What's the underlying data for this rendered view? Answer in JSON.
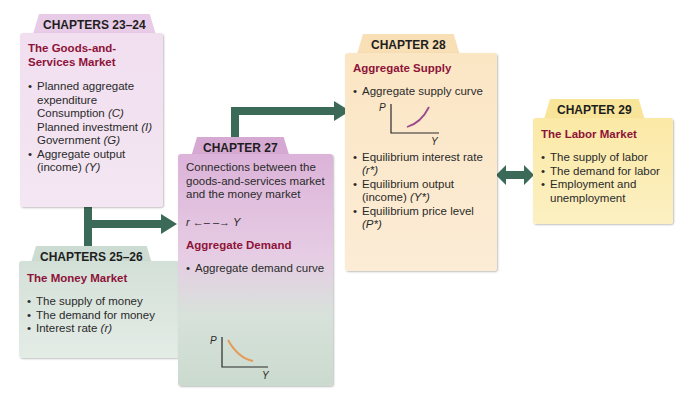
{
  "colors": {
    "title_accent": "#8e1338",
    "arrow": "#3c6a58",
    "ad_curve": "#e79a57",
    "as_curve": "#9a4a8c"
  },
  "boxes": {
    "ch23_24": {
      "tab": "CHAPTERS 23–24",
      "title": "The Goods-and-Services Market",
      "items": [
        {
          "text": "Planned aggregate expenditure",
          "bullet": true
        },
        {
          "text": "Consumption ",
          "var": "(C)",
          "bullet": false
        },
        {
          "text": "Planned investment ",
          "var": "(I)",
          "bullet": false
        },
        {
          "text": "Government ",
          "var": "(G)",
          "bullet": false
        },
        {
          "text": "Aggregate output (income) ",
          "var": "(Y)",
          "bullet": true
        }
      ]
    },
    "ch25_26": {
      "tab": "CHAPTERS 25–26",
      "title": "The Money Market",
      "items": [
        {
          "text": "The supply of money"
        },
        {
          "text": "The demand for money"
        },
        {
          "text": "Interest rate ",
          "var": "(r)"
        }
      ]
    },
    "ch27": {
      "tab": "CHAPTER 27",
      "intro": "Connections between the goods-and-services market and the money market",
      "relation": {
        "left": "r",
        "arrow": "←– –→",
        "right": "Y"
      },
      "title": "Aggregate Demand",
      "items": [
        {
          "text": "Aggregate demand curve"
        }
      ],
      "graph": {
        "y_axis": "P",
        "x_axis": "Y",
        "curve": "downward-sloping"
      }
    },
    "ch28": {
      "tab": "CHAPTER 28",
      "title": "Aggregate Supply",
      "items": [
        {
          "text": "Aggregate supply curve"
        },
        {
          "text": "Equilibrium interest rate ",
          "var": "(r*)"
        },
        {
          "text": "Equilibrium output (income) ",
          "var": "(Y*)"
        },
        {
          "text": "Equilibrium price level ",
          "var": "(P*)"
        }
      ],
      "graph": {
        "y_axis": "P",
        "x_axis": "Y",
        "curve": "upward-sloping"
      }
    },
    "ch29": {
      "tab": "CHAPTER 29",
      "title": "The Labor Market",
      "items": [
        {
          "text": "The supply of labor"
        },
        {
          "text": "The demand for labor"
        },
        {
          "text": "Employment and unemployment"
        }
      ]
    }
  }
}
